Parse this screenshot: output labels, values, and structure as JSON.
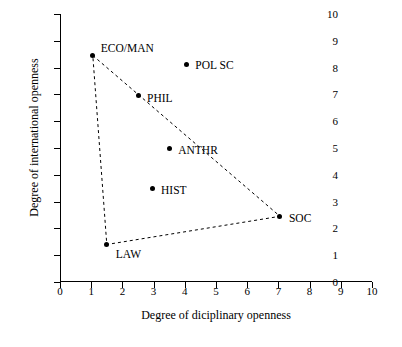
{
  "chart_data": {
    "type": "scatter",
    "title": "",
    "xlabel": "Degree of diciplinary openness",
    "ylabel": "Degree of international openness",
    "xlim": [
      0,
      10
    ],
    "ylim": [
      0,
      10
    ],
    "xticks": [
      0,
      1,
      2,
      3,
      4,
      5,
      6,
      7,
      8,
      9,
      10
    ],
    "yticks": [
      0,
      1,
      2,
      3,
      4,
      5,
      6,
      7,
      8,
      9,
      10
    ],
    "grid": false,
    "legend": "none",
    "points": [
      {
        "label": "ECO/MAN",
        "x": 1.05,
        "y": 8.45,
        "label_dx": 8,
        "label_dy": -14
      },
      {
        "label": "POL SC",
        "x": 4.05,
        "y": 8.1,
        "label_dx": 9,
        "label_dy": -6
      },
      {
        "label": "PHIL",
        "x": 2.5,
        "y": 6.95,
        "label_dx": 9,
        "label_dy": -4
      },
      {
        "label": "ANTHR",
        "x": 3.5,
        "y": 5.0,
        "label_dx": 9,
        "label_dy": -4
      },
      {
        "label": "HIST",
        "x": 2.95,
        "y": 3.5,
        "label_dx": 9,
        "label_dy": -4
      },
      {
        "label": "SOC",
        "x": 7.05,
        "y": 2.45,
        "label_dx": 9,
        "label_dy": -4
      },
      {
        "label": "LAW",
        "x": 1.5,
        "y": 1.4,
        "label_dx": 9,
        "label_dy": 4
      }
    ],
    "hull": [
      "ECO/MAN",
      "SOC",
      "LAW"
    ],
    "hull_style": "dashed",
    "hull_color": "#000000",
    "point_color": "#000000"
  }
}
